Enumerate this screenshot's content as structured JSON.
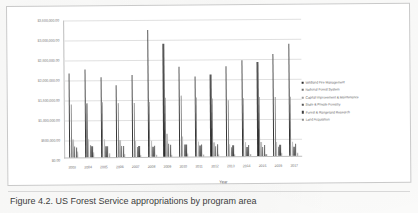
{
  "caption": {
    "text": "Figure 4.2. US Forest Service appropriations by program area"
  },
  "chart_data": {
    "type": "bar",
    "title": "",
    "xlabel": "Year",
    "ylabel": "Amount Enacted (in thousands)",
    "ylim": [
      0,
      3500000
    ],
    "ytick_labels": [
      "$3,500,000.00",
      "$3,000,000.00",
      "$2,500,000.00",
      "$2,000,000.00",
      "$1,500,000.00",
      "$1,000,000.00",
      "$500,000.00",
      "$0.00"
    ],
    "ytick_values": [
      3500000,
      3000000,
      2500000,
      2000000,
      1500000,
      1000000,
      500000,
      0
    ],
    "grid": true,
    "legend_position": "right",
    "categories": [
      "2003",
      "2004",
      "2005",
      "2006",
      "2007",
      "2008",
      "2009",
      "2010",
      "2011",
      "2012",
      "2013",
      "2014",
      "2015",
      "2016",
      "2017"
    ],
    "series": [
      {
        "name": "Wildland Fire Management",
        "color": "#2b2b2b",
        "values": [
          2150000,
          2250000,
          2050000,
          1850000,
          2100000,
          3250000,
          2900000,
          2300000,
          2050000,
          2100000,
          2300000,
          2450000,
          2400000,
          2600000,
          2850000
        ]
      },
      {
        "name": "National Forest System",
        "color": "#6f6f6f",
        "values": [
          1350000,
          1390000,
          1410000,
          1380000,
          1380000,
          1400000,
          1520000,
          1550000,
          1500000,
          1480000,
          1420000,
          1490000,
          1500000,
          1500000,
          1500000
        ]
      },
      {
        "name": "Capital Improvement & Maintenance",
        "color": "#9d9d9d",
        "values": [
          450000,
          470000,
          460000,
          430000,
          400000,
          400000,
          580000,
          500000,
          380000,
          350000,
          310000,
          350000,
          350000,
          350000,
          350000
        ]
      },
      {
        "name": "State & Private Forestry",
        "color": "#555555",
        "values": [
          290000,
          300000,
          290000,
          270000,
          250000,
          250000,
          320000,
          310000,
          270000,
          250000,
          230000,
          240000,
          240000,
          240000,
          240000
        ]
      },
      {
        "name": "Forest & Rangeland Research",
        "color": "#3f3f3f",
        "values": [
          250000,
          270000,
          280000,
          280000,
          280000,
          290000,
          300000,
          310000,
          300000,
          295000,
          280000,
          290000,
          290000,
          290000,
          300000
        ]
      },
      {
        "name": "Land Acquisition",
        "color": "#8c8c8c",
        "values": [
          150000,
          130000,
          100000,
          70000,
          50000,
          50000,
          60000,
          65000,
          60000,
          55000,
          50000,
          55000,
          60000,
          65000,
          70000
        ]
      }
    ]
  }
}
